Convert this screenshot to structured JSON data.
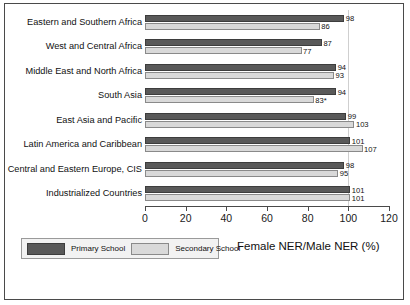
{
  "chart_data": {
    "type": "bar",
    "orientation": "horizontal",
    "title": "",
    "xlabel": "Female NER/Male NER (%)",
    "ylabel": "",
    "xlim": [
      0,
      120
    ],
    "xticks": [
      0,
      20,
      40,
      60,
      80,
      100,
      120
    ],
    "gridlines": [
      100
    ],
    "grid": false,
    "legend_position": "bottom-left",
    "categories": [
      "Eastern and Southern Africa",
      "West and Central Africa",
      "Middle East and North Africa",
      "South Asia",
      "East Asia and Pacific",
      "Latin America and Caribbean",
      "Central and Eastern Europe, CIS",
      "Industrialized Countries"
    ],
    "series": [
      {
        "name": "Primary School",
        "color": "#595959",
        "values": [
          98,
          87,
          94,
          94,
          99,
          101,
          98,
          101
        ],
        "labels": [
          "98",
          "87",
          "94",
          "94",
          "99",
          "101",
          "98",
          "101"
        ]
      },
      {
        "name": "Secondary School",
        "color": "#d9d9d9",
        "values": [
          86,
          77,
          93,
          83,
          103,
          107,
          95,
          101
        ],
        "labels": [
          "86",
          "77",
          "93",
          "83*",
          "103",
          "107",
          "95",
          "101"
        ]
      }
    ]
  },
  "legend": {
    "items": [
      {
        "label": "Primary School",
        "color": "#595959"
      },
      {
        "label": "Secondary School",
        "color": "#d9d9d9"
      }
    ]
  },
  "axis_title": "Female NER/Male NER (%)"
}
